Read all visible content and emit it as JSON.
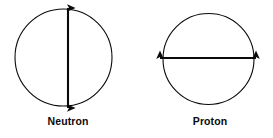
{
  "figure": {
    "background_color": "#ffffff",
    "stroke_color": "#0a0a0a",
    "particles": [
      {
        "id": "neutron",
        "label": "Neutron",
        "circle": {
          "cx": 63.5,
          "cy": 57.5,
          "r": 48.5
        },
        "arrow": {
          "orientation": "vertical",
          "x1": 68,
          "y1": 8,
          "x2": 68,
          "y2": 108,
          "double_headed": true
        },
        "label_position": {
          "cx": 68,
          "y": 122
        }
      },
      {
        "id": "proton",
        "label": "Proton",
        "circle": {
          "cx": 208.5,
          "cy": 59,
          "r": 45.5
        },
        "arrow": {
          "orientation": "horizontal",
          "x1": 160,
          "y1": 58,
          "x2": 256,
          "y2": 58,
          "double_headed": true
        },
        "label_position": {
          "cx": 210,
          "y": 122
        }
      }
    ]
  }
}
